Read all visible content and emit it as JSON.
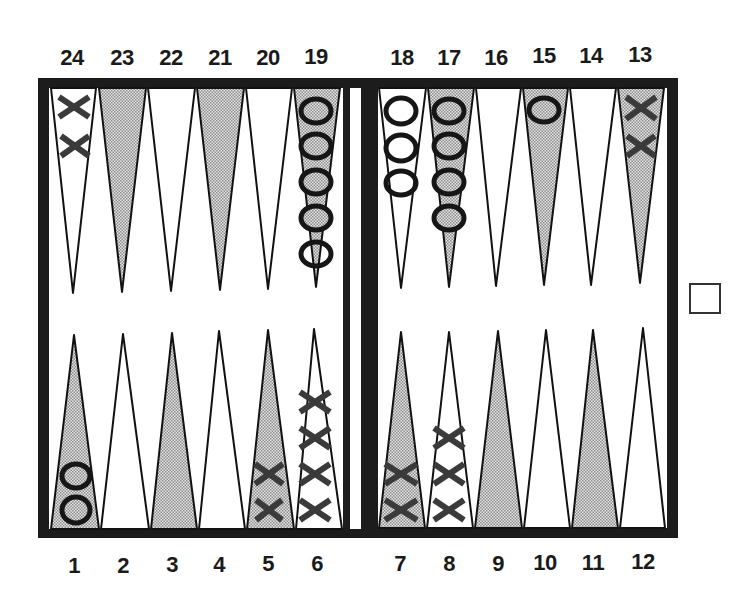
{
  "board": {
    "top_labels": [
      "24",
      "23",
      "22",
      "21",
      "20",
      "19",
      "18",
      "17",
      "16",
      "15",
      "14",
      "13"
    ],
    "bottom_labels": [
      "1",
      "2",
      "3",
      "4",
      "5",
      "6",
      "7",
      "8",
      "9",
      "10",
      "11",
      "12"
    ],
    "colors": {
      "frame": "#1c1c1c",
      "shaded_point": "#c8c8c8",
      "white_point": "#ffffff",
      "checker_o": "#1a1a1a",
      "checker_x": "#3a3a3a"
    }
  },
  "points": [
    {
      "num": 1,
      "shaded": true,
      "checker": "O",
      "count": 2
    },
    {
      "num": 2,
      "shaded": false,
      "checker": null,
      "count": 0
    },
    {
      "num": 3,
      "shaded": true,
      "checker": null,
      "count": 0
    },
    {
      "num": 4,
      "shaded": false,
      "checker": null,
      "count": 0
    },
    {
      "num": 5,
      "shaded": true,
      "checker": "X",
      "count": 2
    },
    {
      "num": 6,
      "shaded": false,
      "checker": "X",
      "count": 4
    },
    {
      "num": 7,
      "shaded": true,
      "checker": "X",
      "count": 2
    },
    {
      "num": 8,
      "shaded": false,
      "checker": "X",
      "count": 3
    },
    {
      "num": 9,
      "shaded": true,
      "checker": null,
      "count": 0
    },
    {
      "num": 10,
      "shaded": false,
      "checker": null,
      "count": 0
    },
    {
      "num": 11,
      "shaded": true,
      "checker": null,
      "count": 0
    },
    {
      "num": 12,
      "shaded": false,
      "checker": null,
      "count": 0
    },
    {
      "num": 13,
      "shaded": true,
      "checker": "X",
      "count": 2
    },
    {
      "num": 14,
      "shaded": false,
      "checker": null,
      "count": 0
    },
    {
      "num": 15,
      "shaded": true,
      "checker": "O",
      "count": 1
    },
    {
      "num": 16,
      "shaded": false,
      "checker": null,
      "count": 0
    },
    {
      "num": 17,
      "shaded": true,
      "checker": "O",
      "count": 4
    },
    {
      "num": 18,
      "shaded": false,
      "checker": "O",
      "count": 3
    },
    {
      "num": 19,
      "shaded": true,
      "checker": "O",
      "count": 5
    },
    {
      "num": 20,
      "shaded": false,
      "checker": null,
      "count": 0
    },
    {
      "num": 21,
      "shaded": true,
      "checker": null,
      "count": 0
    },
    {
      "num": 22,
      "shaded": false,
      "checker": null,
      "count": 0
    },
    {
      "num": 23,
      "shaded": true,
      "checker": null,
      "count": 0
    },
    {
      "num": 24,
      "shaded": false,
      "checker": "X",
      "count": 2
    }
  ],
  "doubling_cube": {
    "value": ""
  }
}
